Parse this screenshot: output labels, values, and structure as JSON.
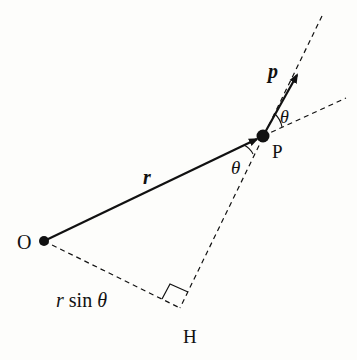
{
  "diagram": {
    "background": "#fdfdfb",
    "ink": "#111111",
    "points": {
      "O": {
        "label": "O",
        "x": 44,
        "y": 241
      },
      "P": {
        "label": "P",
        "x": 263,
        "y": 136
      },
      "H": {
        "label": "H",
        "x": 180,
        "y": 308
      }
    },
    "vectors": {
      "r": {
        "label": "r",
        "from": "O",
        "to": "P"
      },
      "p": {
        "label": "p",
        "from": "P",
        "tip": [
          298,
          73
        ]
      }
    },
    "angles": {
      "theta_at_P_lower": {
        "label": "θ"
      },
      "theta_at_P_upper": {
        "label": "θ"
      }
    },
    "segments": {
      "OH": {
        "label": "r sin θ",
        "style": "dashed"
      },
      "PH_line": {
        "style": "dashed"
      },
      "r_extension": {
        "style": "dashed"
      }
    },
    "labels": {
      "O": "O",
      "P": "P",
      "H": "H",
      "r": "r",
      "p": "p",
      "theta1": "θ",
      "theta2": "θ",
      "rsin_r": "r",
      "rsin_rest": " sin ",
      "rsin_theta": "θ"
    }
  }
}
